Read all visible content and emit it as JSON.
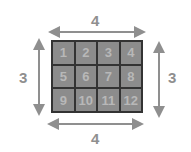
{
  "diagram": {
    "cells": [
      "1",
      "2",
      "3",
      "4",
      "5",
      "6",
      "7",
      "8",
      "9",
      "10",
      "11",
      "12"
    ],
    "labels": {
      "top": "4",
      "bottom": "4",
      "left": "3",
      "right": "3"
    },
    "colors": {
      "cell_fill": "#8c8c8c",
      "cell_text": "#b8b8b8",
      "grid_line": "#333333",
      "arrow": "#8f8f8f",
      "label": "#8f8f8f"
    }
  }
}
